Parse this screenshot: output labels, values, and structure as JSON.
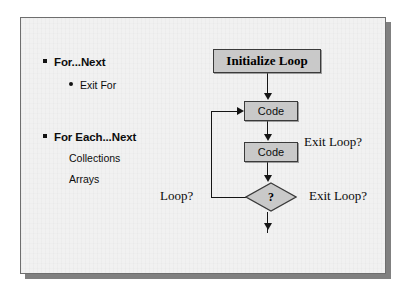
{
  "slide": {
    "background_color": "#f1f1f1",
    "border_color": "#6e6e6e",
    "shadow_color": "#808080"
  },
  "outline": {
    "groups": [
      {
        "marker": "square-bullet",
        "label": "For...Next",
        "children": [
          {
            "marker": "round-bullet",
            "label": "Exit For"
          }
        ]
      },
      {
        "marker": "square-bullet",
        "label": "For Each...Next",
        "children": [
          {
            "marker": "none",
            "label": "Collections"
          },
          {
            "marker": "none",
            "label": "Arrays"
          }
        ]
      }
    ]
  },
  "flowchart": {
    "nodes": {
      "initialize": "Initialize Loop",
      "code_first": "Code",
      "code_second": "Code",
      "decision": "?"
    },
    "captions": {
      "exit_loop_middle": "Exit Loop?",
      "exit_loop_bottom": "Exit Loop?",
      "loop_back": "Loop?"
    },
    "colors": {
      "node_fill": "#c9c9c9",
      "node_border": "#3a3a3a",
      "connector": "#151515"
    }
  }
}
